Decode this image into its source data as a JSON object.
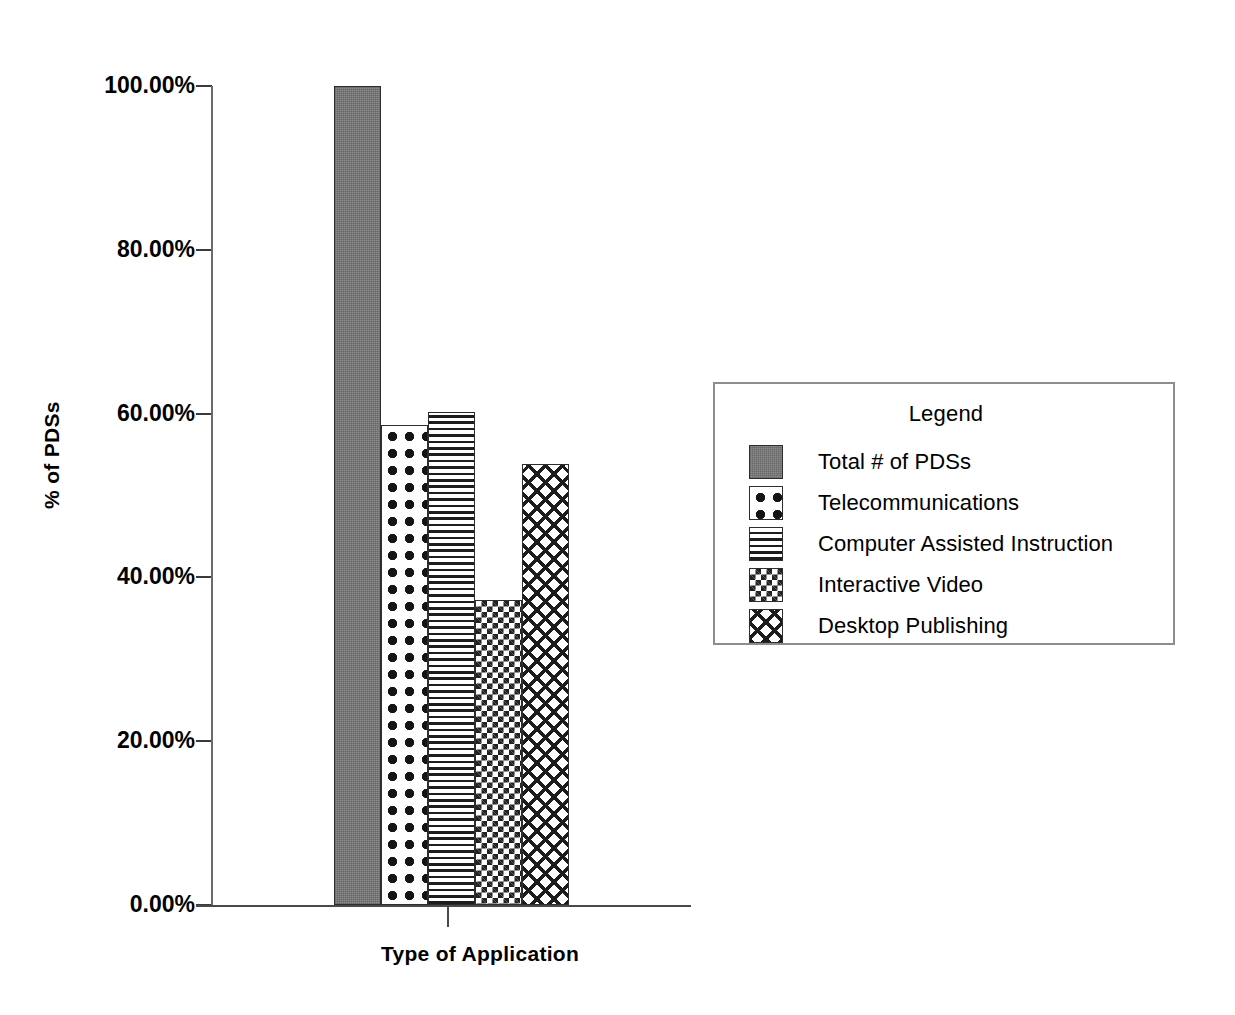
{
  "chart_data": {
    "type": "bar",
    "title": "",
    "xlabel": "Type of Application",
    "ylabel": "% of PDSs",
    "categories": [
      "Total # of PDSs",
      "Telecommunications",
      "Computer Assisted Instruction",
      "Interactive Video",
      "Desktop Publishing"
    ],
    "values": [
      100.0,
      58.6,
      60.2,
      37.2,
      53.8
    ],
    "value_labels": [
      "100.00%",
      "58.60%",
      "60.20%",
      "37.20%",
      "53.80%"
    ],
    "ylim": [
      0,
      100
    ],
    "ytick_values": [
      0,
      20,
      40,
      60,
      80,
      100
    ],
    "ytick_labels": [
      "0.00%",
      "20.00%",
      "40.00%",
      "60.00%",
      "80.00%",
      "100.00%"
    ],
    "xtick_labels": [
      ""
    ],
    "grid": false,
    "legend_position": "right",
    "legend_title": "Legend",
    "series": [
      {
        "name": "Total # of PDSs",
        "value": 100.0,
        "pattern": "solid-gray",
        "color": "#8a8a8a"
      },
      {
        "name": "Telecommunications",
        "value": 58.6,
        "pattern": "dots",
        "color": "#141414"
      },
      {
        "name": "Computer Assisted Instruction",
        "value": 60.2,
        "pattern": "horizontal-lines",
        "color": "#1d1d1d"
      },
      {
        "name": "Interactive Video",
        "value": 37.2,
        "pattern": "checker-small",
        "color": "#222222"
      },
      {
        "name": "Desktop Publishing",
        "value": 53.8,
        "pattern": "crosshatch",
        "color": "#1c1c1c"
      }
    ]
  },
  "axes": {
    "y_title": "% of PDSs",
    "x_title": "Type of Application",
    "ytick_labels": [
      "100.00%",
      "80.00%",
      "60.00%",
      "40.00%",
      "20.00%",
      "0.00%"
    ]
  },
  "legend": {
    "title": "Legend",
    "items": [
      {
        "label": "Total # of PDSs",
        "pattern": "solid-gray"
      },
      {
        "label": "Telecommunications",
        "pattern": "dots"
      },
      {
        "label": "Computer Assisted Instruction",
        "pattern": "horizontal-lines"
      },
      {
        "label": "Interactive Video",
        "pattern": "checker-small"
      },
      {
        "label": "Desktop Publishing",
        "pattern": "crosshatch"
      }
    ]
  },
  "colors": {
    "background": "#ffffff",
    "axis": "#4a4a4a",
    "text": "#000000",
    "bar_outline": "#2d2d2d",
    "legend_border": "#8d8d8d"
  }
}
